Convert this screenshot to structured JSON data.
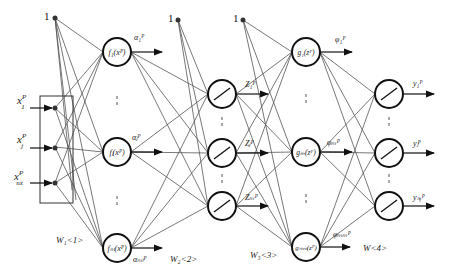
{
  "diagram": {
    "title": "",
    "bias_label": "1",
    "inputs": [
      {
        "label": "x",
        "sub": "1",
        "sup": "P"
      },
      {
        "label": "x",
        "sub": "j",
        "sup": "P"
      },
      {
        "label": "x",
        "sub": "nx",
        "sup": "P"
      }
    ],
    "layer1": {
      "nodes": [
        {
          "label": "f₁(xᴾ)"
        },
        {
          "label": "fⱼ(xᴾ)"
        },
        {
          "label": "fₘ(xᴾ)"
        }
      ],
      "outputs": [
        "α₁ᴾ",
        "αⱼᴾ",
        "αₘₗᴾ"
      ],
      "weight_label": "W₁<1>"
    },
    "layer2": {
      "node_type": "linear",
      "outputs": [
        "Z₁ᴾ",
        "Zⱼᴾ",
        "Zₘᴾ"
      ],
      "weight_label": "W₂<2>"
    },
    "layer3": {
      "nodes": [
        {
          "label": "g₁(zᴾ)"
        },
        {
          "label": "gₘ(zᴾ)"
        },
        {
          "label": "gₘₘ(zᴾ)"
        }
      ],
      "outputs": [
        "φ₁ᴾ",
        "φₘᴾ",
        "φₘₘᴾ"
      ],
      "weight_label": "W₃<3>"
    },
    "layer4": {
      "node_type": "linear",
      "outputs": [
        "y₁ᴾ",
        "yⱼᴾ",
        "yₙᵧᴾ"
      ],
      "weight_label": "W<4>"
    }
  }
}
